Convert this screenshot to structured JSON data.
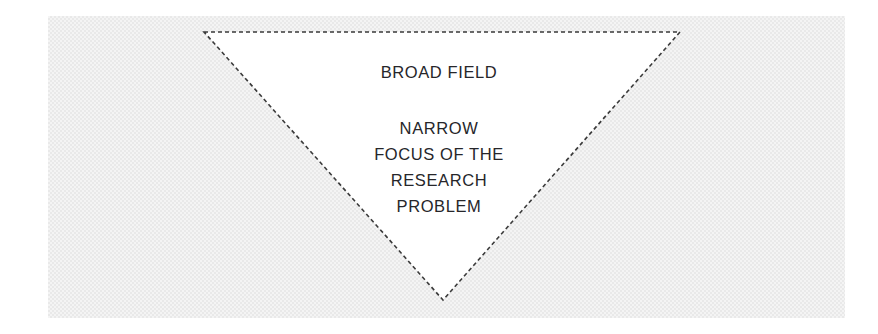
{
  "figure": {
    "name": "research-funnel-diagram",
    "panel": {
      "x": 48,
      "y": 16,
      "width": 797,
      "height": 302,
      "fill_color": "#f4f4f4",
      "texture_color": "#e9e9e9"
    },
    "triangle": {
      "name": "inverted-dashed-triangle",
      "orientation": "inverted",
      "fill_color": "#ffffff",
      "stroke_color": "#3a3a3a",
      "stroke_width": 1.6,
      "stroke_style": "dashed",
      "dash_pattern": "4 3",
      "vertices": [
        {
          "label": "top-left",
          "x": 204,
          "y": 32
        },
        {
          "label": "top-right",
          "x": 680,
          "y": 32
        },
        {
          "label": "apex",
          "x": 443,
          "y": 300
        }
      ]
    },
    "labels": {
      "top": "BROAD FIELD",
      "focus_lines": [
        "NARROW",
        "FOCUS OF THE",
        "RESEARCH",
        "PROBLEM"
      ],
      "text_color": "#26262a"
    }
  }
}
